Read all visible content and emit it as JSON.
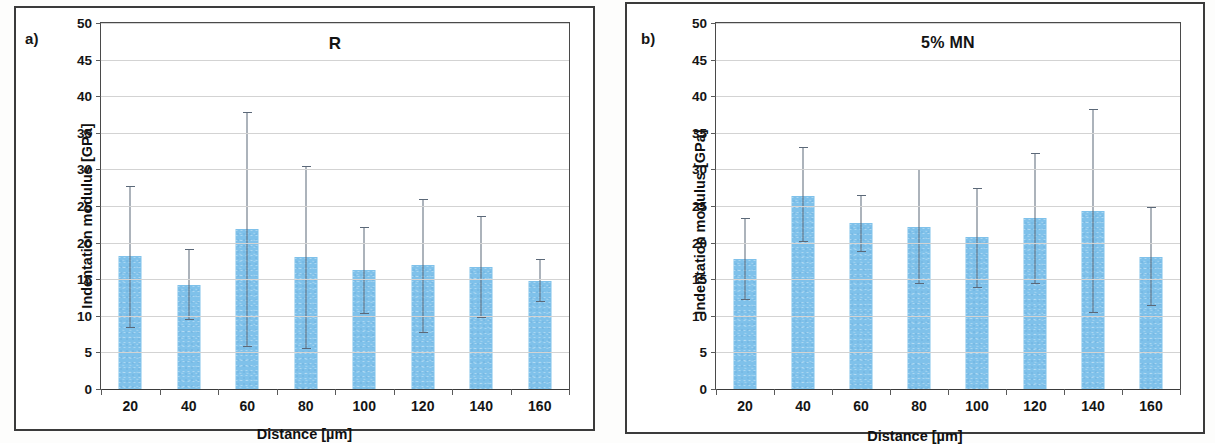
{
  "figure": {
    "background_color": "#ffffff",
    "bar_color": "#7FC1EA",
    "error_bar_color": "#5b6878",
    "axis_color": "#3b3b3b",
    "grid_color": "#d3d3d3"
  },
  "panels": [
    {
      "letter": "a)",
      "title": "R",
      "ylabel": "Indentation modulus [GPa]",
      "xlabel": "Distance [µm]"
    },
    {
      "letter": "b)",
      "title": "5% MN",
      "ylabel": "Indentation modulus [GPa]",
      "xlabel": "Distance [µm]"
    }
  ],
  "chart_data": [
    {
      "type": "bar",
      "panel": "a)",
      "title": "R",
      "xlabel": "Distance [µm]",
      "ylabel": "Indentation modulus [GPa]",
      "categories": [
        "20",
        "40",
        "60",
        "80",
        "100",
        "120",
        "140",
        "160"
      ],
      "values": [
        18.2,
        14.2,
        21.9,
        18.1,
        16.3,
        16.9,
        16.7,
        14.8
      ],
      "error_low": [
        8.4,
        9.4,
        5.8,
        5.4,
        10.3,
        7.6,
        9.7,
        11.9
      ],
      "error_high": [
        27.7,
        19.1,
        37.8,
        30.5,
        22.1,
        26.0,
        23.7,
        17.7
      ],
      "ylim": [
        0,
        50
      ],
      "ytick_labels": [
        "0",
        "5",
        "10",
        "15",
        "20",
        "25",
        "30",
        "35",
        "40",
        "45",
        "50"
      ],
      "ytick_values": [
        0,
        5,
        10,
        15,
        20,
        25,
        30,
        35,
        40,
        45,
        50
      ],
      "grid": true,
      "legend": null
    },
    {
      "type": "bar",
      "panel": "b)",
      "title": "5% MN",
      "xlabel": "Distance [µm]",
      "ylabel": "Indentation modulus [GPa]",
      "categories": [
        "20",
        "40",
        "60",
        "80",
        "100",
        "120",
        "140",
        "160"
      ],
      "values": [
        17.7,
        26.4,
        22.7,
        22.1,
        20.8,
        23.3,
        24.3,
        18.0
      ],
      "error_low": [
        12.1,
        20.1,
        18.7,
        14.3,
        13.8,
        14.3,
        10.4,
        11.4
      ],
      "error_high": [
        23.3,
        33.0,
        26.5,
        30.0,
        27.4,
        32.3,
        38.2,
        24.8
      ],
      "ylim": [
        0,
        50
      ],
      "ytick_labels": [
        "0",
        "5",
        "10",
        "15",
        "20",
        "25",
        "30",
        "35",
        "40",
        "45",
        "50"
      ],
      "ytick_values": [
        0,
        5,
        10,
        15,
        20,
        25,
        30,
        35,
        40,
        45,
        50
      ],
      "grid": true,
      "legend": null
    }
  ]
}
